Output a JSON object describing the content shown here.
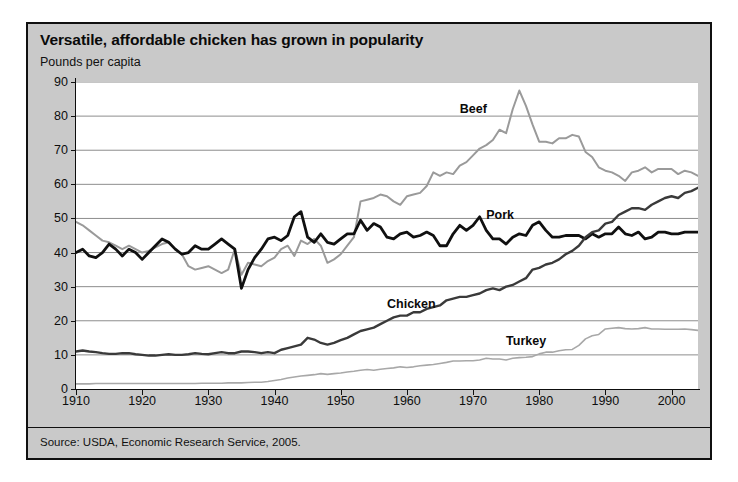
{
  "figure": {
    "title": "Versatile, affordable chicken has grown in popularity",
    "subtitle": "Pounds per capita",
    "source": "Source: USDA, Economic Research Service, 2005."
  },
  "chart_data": {
    "type": "line",
    "title": "Versatile, affordable chicken has grown in popularity",
    "subtitle": "Pounds per capita",
    "xlabel": "",
    "ylabel": "Pounds per capita",
    "xlim": [
      1910,
      2004
    ],
    "ylim": [
      0,
      90
    ],
    "yticks": [
      0,
      10,
      20,
      30,
      40,
      50,
      60,
      70,
      80,
      90
    ],
    "xticks": [
      1910,
      1920,
      1930,
      1940,
      1950,
      1960,
      1970,
      1980,
      1990,
      2000
    ],
    "grid": "horizontal",
    "legend_position": "inline-annotations",
    "annotations": [
      {
        "text": "Beef",
        "x": 1968,
        "y": 84
      },
      {
        "text": "Pork",
        "x": 1972,
        "y": 53
      },
      {
        "text": "Chicken",
        "x": 1957,
        "y": 27
      },
      {
        "text": "Turkey",
        "x": 1975,
        "y": 16
      }
    ],
    "colors": {
      "beef": "#9a9a9a",
      "pork": "#101010",
      "chicken": "#3a3a3a",
      "turkey": "#a8a8a8"
    },
    "x": [
      1910,
      1911,
      1912,
      1913,
      1914,
      1915,
      1916,
      1917,
      1918,
      1919,
      1920,
      1921,
      1922,
      1923,
      1924,
      1925,
      1926,
      1927,
      1928,
      1929,
      1930,
      1931,
      1932,
      1933,
      1934,
      1935,
      1936,
      1937,
      1938,
      1939,
      1940,
      1941,
      1942,
      1943,
      1944,
      1945,
      1946,
      1947,
      1948,
      1949,
      1950,
      1951,
      1952,
      1953,
      1954,
      1955,
      1956,
      1957,
      1958,
      1959,
      1960,
      1961,
      1962,
      1963,
      1964,
      1965,
      1966,
      1967,
      1968,
      1969,
      1970,
      1971,
      1972,
      1973,
      1974,
      1975,
      1976,
      1977,
      1978,
      1979,
      1980,
      1981,
      1982,
      1983,
      1984,
      1985,
      1986,
      1987,
      1988,
      1989,
      1990,
      1991,
      1992,
      1993,
      1994,
      1995,
      1996,
      1997,
      1998,
      1999,
      2000,
      2001,
      2002,
      2003,
      2004
    ],
    "series": [
      {
        "name": "Beef",
        "color": "#9a9a9a",
        "values": [
          49.0,
          48.0,
          46.5,
          45.0,
          43.5,
          43.0,
          42.0,
          41.0,
          42.0,
          41.0,
          40.0,
          40.5,
          41.5,
          42.5,
          43.0,
          41.0,
          39.5,
          36.0,
          35.0,
          35.5,
          36.0,
          35.0,
          34.0,
          35.0,
          41.0,
          33.5,
          37.0,
          36.5,
          36.0,
          37.5,
          38.5,
          41.0,
          42.0,
          39.0,
          43.5,
          42.5,
          44.0,
          42.0,
          37.0,
          38.0,
          39.5,
          42.0,
          44.5,
          55.0,
          55.5,
          56.0,
          57.0,
          56.5,
          55.0,
          54.0,
          56.5,
          57.0,
          57.5,
          59.5,
          63.5,
          62.5,
          63.5,
          63.0,
          65.5,
          66.5,
          68.5,
          70.5,
          71.5,
          73.0,
          76.0,
          75.0,
          82.0,
          87.5,
          83.0,
          77.5,
          72.5,
          72.5,
          72.0,
          73.5,
          73.5,
          74.5,
          74.0,
          69.5,
          68.0,
          65.0,
          64.0,
          63.5,
          62.5,
          61.0,
          63.5,
          64.0,
          65.0,
          63.5,
          64.5,
          64.5,
          64.5,
          63.0,
          64.0,
          63.5,
          62.5
        ]
      },
      {
        "name": "Pork",
        "color": "#101010",
        "values": [
          40.0,
          41.0,
          39.0,
          38.5,
          40.0,
          42.5,
          41.0,
          39.0,
          41.0,
          40.0,
          38.0,
          40.0,
          42.0,
          44.0,
          43.0,
          41.0,
          39.5,
          40.0,
          42.0,
          41.0,
          41.0,
          42.5,
          44.0,
          42.5,
          41.0,
          29.5,
          35.0,
          38.5,
          41.0,
          44.0,
          44.5,
          43.5,
          45.0,
          50.5,
          52.0,
          44.5,
          43.0,
          45.5,
          43.0,
          42.5,
          44.0,
          45.5,
          45.5,
          49.5,
          46.5,
          48.5,
          47.5,
          44.5,
          44.0,
          45.5,
          46.0,
          44.5,
          45.0,
          46.0,
          45.0,
          42.0,
          42.0,
          45.5,
          48.0,
          46.5,
          48.0,
          50.5,
          46.5,
          44.0,
          44.0,
          42.5,
          44.5,
          45.5,
          45.0,
          48.0,
          49.0,
          46.5,
          44.5,
          44.5,
          45.0,
          45.0,
          45.0,
          44.0,
          45.5,
          44.5,
          45.5,
          45.5,
          47.5,
          45.5,
          45.0,
          46.0,
          44.0,
          44.5,
          46.0,
          46.0,
          45.5,
          45.5,
          46.0,
          46.0,
          46.0
        ]
      },
      {
        "name": "Chicken",
        "color": "#3a3a3a",
        "values": [
          11.0,
          11.3,
          11.0,
          10.8,
          10.5,
          10.3,
          10.3,
          10.5,
          10.5,
          10.2,
          10.0,
          9.8,
          9.8,
          10.0,
          10.2,
          10.0,
          10.0,
          10.2,
          10.5,
          10.3,
          10.2,
          10.5,
          10.8,
          10.5,
          10.5,
          11.0,
          11.0,
          10.8,
          10.5,
          10.8,
          10.5,
          11.5,
          12.0,
          12.5,
          13.0,
          15.0,
          14.5,
          13.5,
          13.0,
          13.5,
          14.3,
          15.0,
          16.0,
          17.0,
          17.5,
          18.0,
          19.0,
          20.0,
          21.0,
          21.5,
          21.5,
          22.5,
          22.5,
          23.5,
          24.0,
          24.5,
          26.0,
          26.5,
          27.0,
          27.0,
          27.5,
          28.0,
          29.0,
          29.5,
          29.0,
          30.0,
          30.5,
          31.5,
          32.5,
          35.0,
          35.5,
          36.5,
          37.0,
          38.0,
          39.5,
          40.5,
          42.0,
          44.5,
          46.0,
          46.5,
          48.5,
          49.0,
          51.0,
          52.0,
          53.0,
          53.0,
          52.5,
          54.0,
          55.0,
          56.0,
          56.5,
          56.0,
          57.5,
          58.0,
          59.0
        ]
      },
      {
        "name": "Turkey",
        "color": "#a8a8a8",
        "values": [
          1.5,
          1.5,
          1.5,
          1.6,
          1.6,
          1.6,
          1.6,
          1.6,
          1.6,
          1.6,
          1.6,
          1.6,
          1.6,
          1.6,
          1.6,
          1.6,
          1.6,
          1.6,
          1.6,
          1.7,
          1.7,
          1.7,
          1.7,
          1.8,
          1.8,
          1.8,
          1.9,
          2.0,
          2.0,
          2.2,
          2.5,
          2.8,
          3.2,
          3.5,
          3.8,
          4.0,
          4.2,
          4.5,
          4.3,
          4.5,
          4.7,
          5.0,
          5.2,
          5.5,
          5.7,
          5.5,
          5.8,
          6.0,
          6.2,
          6.5,
          6.3,
          6.5,
          6.8,
          7.0,
          7.2,
          7.5,
          7.8,
          8.2,
          8.2,
          8.3,
          8.3,
          8.5,
          9.0,
          8.8,
          8.8,
          8.5,
          9.0,
          9.2,
          9.3,
          9.5,
          10.3,
          10.8,
          10.8,
          11.2,
          11.5,
          11.6,
          12.8,
          14.7,
          15.6,
          16.0,
          17.6,
          17.8,
          18.0,
          17.7,
          17.6,
          17.7,
          18.0,
          17.6,
          17.6,
          17.5,
          17.5,
          17.5,
          17.6,
          17.4,
          17.2
        ]
      }
    ]
  }
}
